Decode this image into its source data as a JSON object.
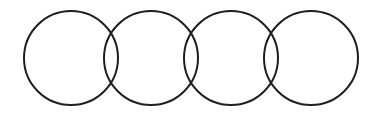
{
  "diagram": {
    "type": "chain-of-overlapping-circles",
    "background": "#ffffff",
    "stroke_color": "#1e1e1e",
    "stroke_width": 2,
    "circle_count": 4,
    "radius": 47,
    "circles": [
      {
        "cx": 71,
        "cy": 58
      },
      {
        "cx": 151,
        "cy": 58
      },
      {
        "cx": 231,
        "cy": 58
      },
      {
        "cx": 311,
        "cy": 58
      }
    ]
  }
}
